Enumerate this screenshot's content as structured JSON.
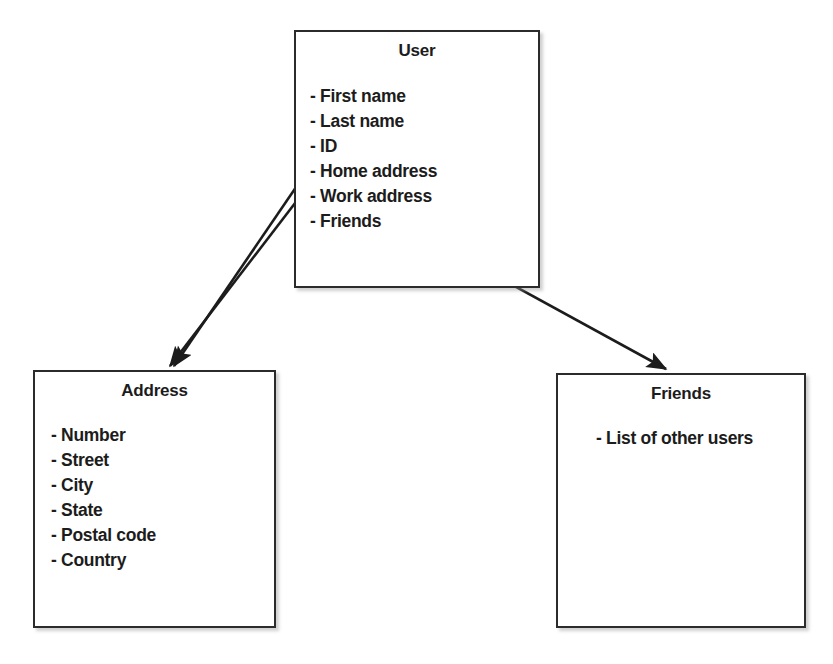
{
  "diagram": {
    "background_color": "#ffffff",
    "line_color": "#2b2b2b",
    "text_color": "#1c1c1c"
  },
  "entities": {
    "user": {
      "title": "User",
      "attributes": [
        "- First name",
        "- Last name",
        "- ID",
        "- Home address",
        "- Work address",
        "- Friends"
      ]
    },
    "address": {
      "title": "Address",
      "attributes": [
        "- Number",
        "- Street",
        "- City",
        "- State",
        "- Postal code",
        "- Country"
      ]
    },
    "friends": {
      "title": "Friends",
      "attributes": [
        "- List of other users"
      ]
    }
  },
  "connectors": [
    {
      "name": "home-address-to-address",
      "from": "User.Home address",
      "to": "Address",
      "label": ""
    },
    {
      "name": "work-address-to-address",
      "from": "User.Work address",
      "to": "Address",
      "label": ""
    },
    {
      "name": "friends-to-friends",
      "from": "User.Friends",
      "to": "Friends",
      "label": ""
    }
  ]
}
